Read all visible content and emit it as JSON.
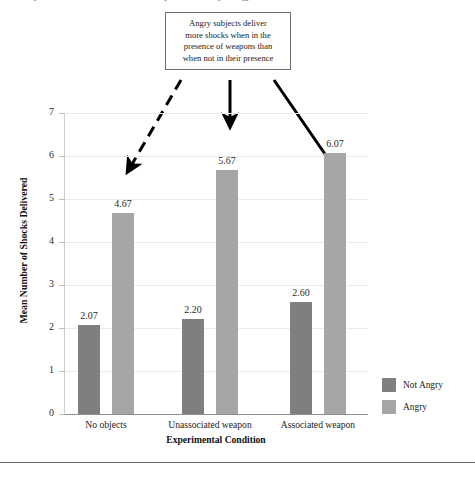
{
  "figure": {
    "top_caption_sliver": "published in the Journal of Personality and Social Psychology, 1967.",
    "bottom_rule": "horizontal-rule"
  },
  "annotation": {
    "box_lines": [
      "Angry subjects deliver",
      "more shocks when in the",
      "presence of weapons than",
      "when not in their presence"
    ],
    "arrows": [
      {
        "name": "arrow-to-no-objects-angry",
        "style": "dashed"
      },
      {
        "name": "arrow-to-unassociated-weapon-angry",
        "style": "solid"
      },
      {
        "name": "arrow-to-associated-weapon-angry",
        "style": "solid"
      }
    ]
  },
  "legend": {
    "position": "right",
    "items": [
      {
        "label": "Not Angry",
        "color": "#7f7f7f"
      },
      {
        "label": "Angry",
        "color": "#a6a6a6"
      }
    ]
  },
  "chart_data": {
    "type": "bar",
    "title": "",
    "xlabel": "Experimental Condition",
    "ylabel": "Mean Number of Shocks Delivered",
    "categories": [
      "No objects",
      "Unassociated weapon",
      "Associated weapon"
    ],
    "series": [
      {
        "name": "Not Angry",
        "color": "#7f7f7f",
        "values": [
          2.07,
          2.2,
          2.6
        ]
      },
      {
        "name": "Angry",
        "color": "#a6a6a6",
        "values": [
          4.67,
          5.67,
          6.07
        ]
      }
    ],
    "value_labels": [
      "2.07",
      "4.67",
      "2.20",
      "5.67",
      "2.60",
      "6.07"
    ],
    "ylim": [
      0,
      7
    ],
    "yticks": [
      0,
      1,
      2,
      3,
      4,
      5,
      6,
      7
    ],
    "ytick_labels": [
      "0",
      "1",
      "2",
      "3",
      "4",
      "5",
      "6",
      "7"
    ],
    "grid": true,
    "legend_position": "right"
  }
}
